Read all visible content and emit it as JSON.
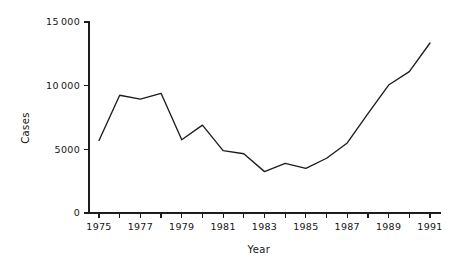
{
  "chart_data": {
    "type": "line",
    "title": "",
    "subtitle": "",
    "xlabel": "Year",
    "ylabel": "Cases",
    "x": [
      1975,
      1976,
      1977,
      1978,
      1979,
      1980,
      1981,
      1982,
      1983,
      1984,
      1985,
      1986,
      1987,
      1988,
      1989,
      1990,
      1991
    ],
    "values": [
      5700,
      9250,
      8950,
      9400,
      5750,
      6900,
      4900,
      4650,
      3250,
      3900,
      3500,
      4300,
      5500,
      7800,
      10050,
      11100,
      13350
    ],
    "series": [
      {
        "name": "Cases",
        "values": [
          5700,
          9250,
          8950,
          9400,
          5750,
          6900,
          4900,
          4650,
          3250,
          3900,
          3500,
          4300,
          5500,
          7800,
          10050,
          11100,
          13350
        ]
      }
    ],
    "xlim": [
      1974.5,
      1991.8
    ],
    "ylim": [
      0,
      15000
    ],
    "y_ticks": [
      0,
      5000,
      10000,
      15000
    ],
    "y_tick_labels": [
      "0",
      "5000",
      "10000",
      "15000"
    ],
    "x_ticks": [
      1975,
      1976,
      1977,
      1978,
      1979,
      1980,
      1981,
      1982,
      1983,
      1984,
      1985,
      1986,
      1987,
      1988,
      1989,
      1990,
      1991
    ],
    "x_tick_labels": [
      "1975",
      "",
      "1977",
      "",
      "1979",
      "",
      "1981",
      "",
      "1983",
      "",
      "1985",
      "",
      "1987",
      "",
      "1989",
      "",
      "1991"
    ],
    "grid": false,
    "legend": false,
    "legend_position": "none",
    "line_color": "#1d1d1d",
    "background_color": "#ffffff",
    "axis_color": "#1d1d1d"
  },
  "axes": {
    "y_title": "Cases",
    "x_title": "Year"
  }
}
